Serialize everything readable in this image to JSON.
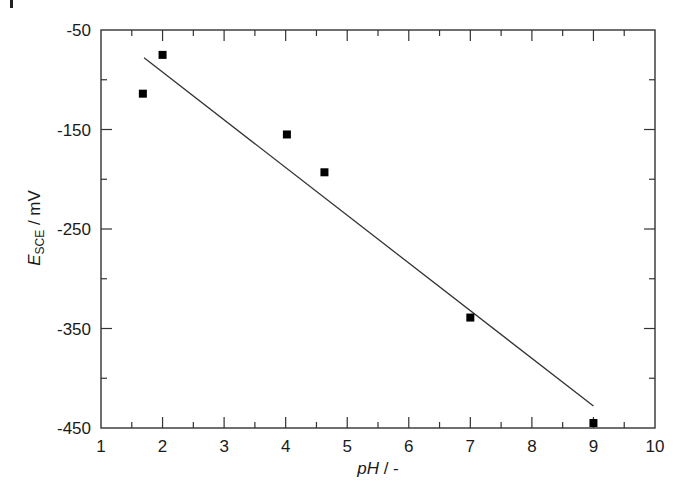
{
  "chart_data": {
    "type": "scatter",
    "title": "",
    "xlabel": "pH / -",
    "ylabel": "E_SCE / mV",
    "ylabel_main": "E",
    "ylabel_sub": "SCE",
    "ylabel_unit": " / mV",
    "xlim": [
      1,
      10
    ],
    "ylim": [
      -450,
      -50
    ],
    "x_ticks": [
      1,
      2,
      3,
      4,
      5,
      6,
      7,
      8,
      9,
      10
    ],
    "x_minor_step": 0.5,
    "y_ticks": [
      -50,
      -150,
      -250,
      -350,
      -450
    ],
    "y_minor_step": 50,
    "grid": false,
    "legend": null,
    "series": [
      {
        "name": "measured",
        "marker": "square",
        "color": "#000000",
        "points": [
          {
            "x": 1.68,
            "y": -114
          },
          {
            "x": 2.0,
            "y": -75
          },
          {
            "x": 4.02,
            "y": -155
          },
          {
            "x": 4.63,
            "y": -193
          },
          {
            "x": 7.0,
            "y": -339
          },
          {
            "x": 9.0,
            "y": -445
          }
        ]
      },
      {
        "name": "linear fit",
        "type": "line",
        "color": "#333333",
        "points": [
          {
            "x": 1.7,
            "y": -78
          },
          {
            "x": 9.0,
            "y": -428
          }
        ]
      }
    ]
  },
  "layout": {
    "plot_left": 101,
    "plot_right": 655,
    "plot_top": 30,
    "plot_bottom": 428,
    "axis_color": "#333333",
    "marker_size": 8
  },
  "labels": {
    "xlabel_text": "pH / -"
  }
}
